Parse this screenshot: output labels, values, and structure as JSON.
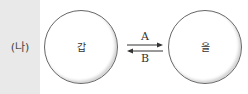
{
  "panel": {
    "label": "(나)"
  },
  "nodes": {
    "left": "갑",
    "right": "을"
  },
  "arrows": {
    "top": "A",
    "bottom": "B"
  }
}
